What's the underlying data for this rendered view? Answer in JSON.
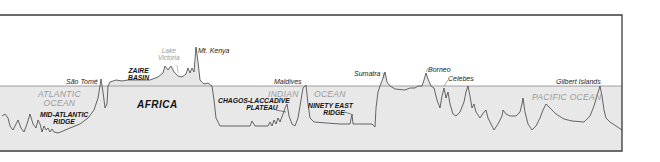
{
  "figure": {
    "type": "topographic-profile",
    "sea_level_label": "",
    "colors": {
      "frame": "#3a3a3a",
      "land_fill": "#e6e6e6",
      "ocean_fill": "#e6e6e6",
      "profile_line": "#555555",
      "sea_level_line": "#8a8a8a",
      "ocean_label": "#9a9a9a"
    }
  },
  "labels": {
    "places": {
      "sao_tome": "São Tomé",
      "mt_kenya": "Mt. Kenya",
      "maldives": "Maldives",
      "sumatra": "Sumatra",
      "borneo": "Borneo",
      "celebes": "Celebes",
      "gilbert_islands": "Gilbert Islands"
    },
    "lake": {
      "line1": "Lake",
      "line2": "Victoria"
    },
    "oceans": {
      "atlantic_1": "ATLANTIC",
      "atlantic_2": "OCEAN",
      "indian_1": "INDIAN",
      "indian_2": "OCEAN",
      "pacific": "PACIFIC OCEAN"
    },
    "features": {
      "mid_atlantic_1": "MID-ATLANTIC",
      "mid_atlantic_2": "RIDGE",
      "zaire_1": "ZAIRE",
      "zaire_2": "BASIN",
      "chagos_1": "CHAGOS-LACCADIVE",
      "chagos_2": "PLATEAU",
      "ninety_east_1": "NINETY EAST",
      "ninety_east_2": "RIDGE"
    },
    "continent": "AFRICA"
  }
}
